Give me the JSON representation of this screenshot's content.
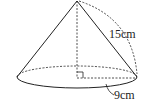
{
  "diagram": {
    "shape": "cone",
    "slant_label": "15cm",
    "radius_label": "9cm",
    "colors": {
      "stroke": "#222222",
      "background": "#ffffff"
    }
  }
}
